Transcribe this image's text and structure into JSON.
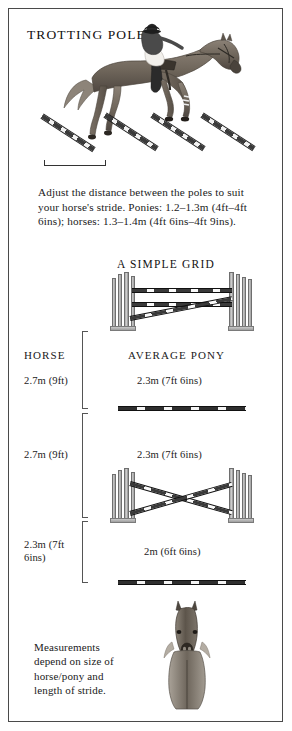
{
  "page": {
    "title": "TROTTING POLES",
    "grid_title": "A SIMPLE GRID"
  },
  "intro_text": "Adjust the distance between the poles to suit your horse's stride. Ponies: 1.2–1.3m (4ft–4ft 6ins); horses: 1.3–1.4m (4ft 6ins–4ft 9ins).",
  "footnote": "Measurements depend on size of horse/pony and length of stride.",
  "columns": {
    "horse": "HORSE",
    "pony": "AVERAGE PONY"
  },
  "distances": [
    {
      "horse": "2.7m (9ft)",
      "pony": "2.3m (7ft 6ins)"
    },
    {
      "horse": "2.7m (9ft)",
      "pony": "2.3m (7ft 6ins)"
    },
    {
      "horse": "2.3m (7ft 6ins)",
      "pony": "2m (6ft 6ins)"
    }
  ],
  "colors": {
    "pole_dark": "#2f2f2f",
    "pole_light": "#f4f4f4",
    "border": "#4a4a4a",
    "text": "#1a1a1a",
    "standard": "#9a9a9a"
  }
}
